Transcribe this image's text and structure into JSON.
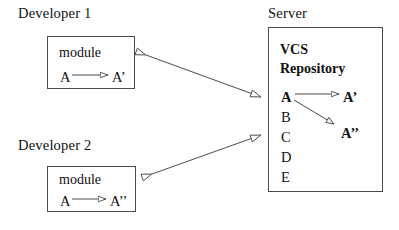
{
  "diagram": {
    "background_color": "#ffffff",
    "line_color": "#4a4a4a",
    "text_color": "#101010"
  },
  "developer1": {
    "caption": "Developer 1",
    "box_title": "module",
    "from_node": "A",
    "to_node": "A’"
  },
  "developer2": {
    "caption": "Developer 2",
    "box_title": "module",
    "from_node": "A",
    "to_node": "A’’"
  },
  "server": {
    "caption": "Server",
    "repo_title_line1": "VCS",
    "repo_title_line2": "Repository",
    "revisions": [
      "A",
      "B",
      "C",
      "D",
      "E"
    ],
    "derived": [
      "A’",
      "A’’"
    ]
  },
  "connectors": {
    "dev1_to_server": "double-headed-arrow",
    "dev2_to_server": "double-headed-arrow",
    "inner_arrow": "open-arrow"
  }
}
